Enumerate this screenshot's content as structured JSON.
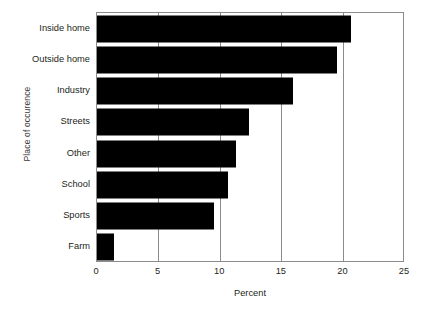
{
  "chart_data": {
    "type": "bar",
    "orientation": "horizontal",
    "title": "",
    "xlabel": "Percent",
    "ylabel": "Place of occurence",
    "categories": [
      "Inside home",
      "Outside home",
      "Industry",
      "Streets",
      "Other",
      "School",
      "Sports",
      "Farm"
    ],
    "values": [
      20.6,
      19.5,
      15.9,
      12.3,
      11.3,
      10.6,
      9.5,
      1.4
    ],
    "xlim": [
      0,
      25
    ],
    "xticks": [
      0,
      5,
      10,
      15,
      20,
      25
    ],
    "xtick_labels": [
      "0",
      "5",
      "10",
      "15",
      "20",
      "25"
    ],
    "gridlines": [
      5,
      10,
      15,
      20
    ],
    "grid": true,
    "legend": "none",
    "bar_color": "#000000",
    "frame_color": "#8c8c8c",
    "background_color": "#ffffff"
  }
}
